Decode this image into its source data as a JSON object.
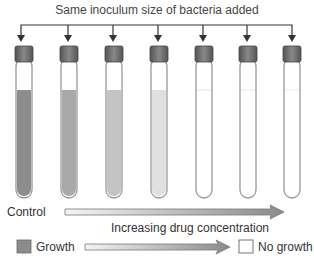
{
  "title": "Same inoculum size of bacteria added",
  "tubes": [
    {
      "index": 1,
      "label": "Control",
      "fill": "#8c8c8c"
    },
    {
      "index": 2,
      "fill": "#a9a9a9"
    },
    {
      "index": 3,
      "fill": "#c4c4c4"
    },
    {
      "index": 4,
      "fill": "#e0e0e0"
    },
    {
      "index": 5,
      "fill": "#f6f6f6"
    },
    {
      "index": 6,
      "fill": "#fafafa"
    },
    {
      "index": 7,
      "fill": "#fcfcfc"
    }
  ],
  "control_label": "Control",
  "arrow_label": "Increasing drug concentration",
  "legend": {
    "growth_label": "Growth",
    "no_growth_label": "No growth",
    "growth_color": "#8c8c8c",
    "no_growth_color": "#ffffff"
  }
}
